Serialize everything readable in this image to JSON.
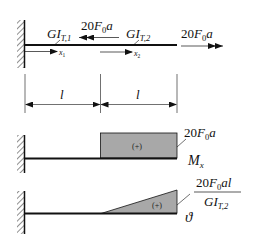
{
  "figure": {
    "kind": "torsion-shaft-diagram",
    "colors": {
      "line": "#111111",
      "fill": "#a8a8a8",
      "background": "#ffffff"
    },
    "shaft": {
      "segments": [
        {
          "stiffness_label": "GI",
          "stiffness_sub": "T,1",
          "axis_label": "x",
          "axis_sub": "1"
        },
        {
          "stiffness_label": "GI",
          "stiffness_sub": "T,2",
          "axis_label": "x",
          "axis_sub": "2"
        }
      ],
      "loads": [
        {
          "label_coef": "20",
          "label_var": "F",
          "label_sub": "0",
          "label_tail": "a",
          "direction": "left",
          "position": "middle"
        },
        {
          "label_coef": "20",
          "label_var": "F",
          "label_sub": "0",
          "label_tail": "a",
          "direction": "right",
          "position": "end"
        }
      ]
    },
    "dimensions": [
      {
        "label": "l"
      },
      {
        "label": "l"
      }
    ],
    "moment_diagram": {
      "name_var": "M",
      "name_sub": "x",
      "sign": "(+)",
      "value_coef": "20",
      "value_var": "F",
      "value_sub": "0",
      "value_tail": "a"
    },
    "twist_diagram": {
      "name": "ϑ",
      "sign": "(+)",
      "num_coef": "20",
      "num_var": "F",
      "num_sub": "0",
      "num_tail": "al",
      "den_var": "GI",
      "den_sub": "T,2"
    }
  }
}
